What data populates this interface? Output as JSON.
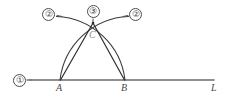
{
  "figure": {
    "type": "geometry-construction",
    "background_color": "#ffffff",
    "stroke_color": "#3a3a3a",
    "baseline_color": "#6b6b6b"
  },
  "labels": {
    "step_line": "①",
    "step_arc_left": "②",
    "step_arc_right": "②",
    "step_intersection": "③",
    "point_a": "A",
    "point_b": "B",
    "point_c": "C",
    "line_l": "L"
  },
  "geometry": {
    "baseline": {
      "x1": 31,
      "y1": 80,
      "x2": 214,
      "y2": 80
    },
    "point_a": {
      "x": 60,
      "y": 80
    },
    "point_b": {
      "x": 125,
      "y": 80
    },
    "point_c": {
      "x": 93,
      "y": 23
    },
    "arc_from_a": {
      "start_x": 60,
      "start_y": 80,
      "end_x": 127,
      "end_y": 17,
      "radius": 72
    },
    "arc_from_b": {
      "start_x": 125,
      "start_y": 80,
      "end_x": 59,
      "end_y": 17,
      "radius": 72
    },
    "segment_ca": {
      "x1": 93,
      "y1": 23,
      "x2": 60,
      "y2": 80
    },
    "segment_cb": {
      "x1": 93,
      "y1": 23,
      "x2": 125,
      "y2": 80
    }
  }
}
